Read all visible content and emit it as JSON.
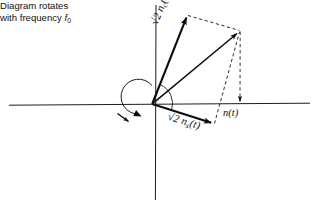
{
  "figure": {
    "background_color": "#ffffff",
    "ink_color": "#0c0c0c",
    "axis_color": "#1d1d1d"
  },
  "axes": {
    "horizontal": {
      "name": "horizontal-axis",
      "y": 104,
      "x_start": 9,
      "x_end": 310
    },
    "vertical": {
      "name": "vertical-axis",
      "x": 156,
      "y_start": 5,
      "y_end": 200
    },
    "origin": {
      "x": 152,
      "y": 104
    }
  },
  "vectors": [
    {
      "id": "nc",
      "label_text": "2 n",
      "label_radical": "√",
      "label_sub": "c",
      "label_suffix": "(t)",
      "label_full": "√2 nc(t)",
      "from": {
        "x": 152,
        "y": 104
      },
      "to": {
        "x": 187,
        "y": 15
      },
      "style": "solid"
    },
    {
      "id": "ns",
      "label_text": "2 n",
      "label_radical": "√",
      "label_sub": "s",
      "label_suffix": "(t)",
      "label_full": "√2 ns(t)",
      "from": {
        "x": 152,
        "y": 104
      },
      "to": {
        "x": 214,
        "y": 124
      },
      "style": "solid"
    },
    {
      "id": "resultant",
      "label_text": "n",
      "label_suffix": "(t)",
      "label_full": "n(t)",
      "from": {
        "x": 152,
        "y": 104
      },
      "to": {
        "x": 240,
        "y": 31
      },
      "style": "solid"
    }
  ],
  "construction_lines": [
    {
      "id": "nc-to-resultant",
      "from": {
        "x": 187,
        "y": 15
      },
      "to": {
        "x": 240,
        "y": 31
      },
      "style": "dashed"
    },
    {
      "id": "ns-to-resultant",
      "from": {
        "x": 214,
        "y": 124
      },
      "to": {
        "x": 240,
        "y": 31
      },
      "style": "dashed"
    },
    {
      "id": "projection-drop",
      "from": {
        "x": 240,
        "y": 31
      },
      "to": {
        "x": 240,
        "y": 104
      },
      "style": "dashed"
    }
  ],
  "arcs": {
    "rotation_circle": {
      "name": "rotation-arc",
      "cx": 152,
      "cy": 103,
      "r": 17.5,
      "direction": "counterclockwise"
    },
    "angle_arc": {
      "name": "angle-arc",
      "cx": 152,
      "cy": 104,
      "r": 21,
      "from_vector": "nc",
      "to_vector": "ns"
    }
  },
  "labels": {
    "nc": {
      "radical": "√",
      "main": "2 n",
      "sub": "c",
      "suffix": "(t)"
    },
    "ns": {
      "radical": "√",
      "main": "2 n",
      "sub": "s",
      "suffix": "(t)"
    },
    "nt": {
      "main": "n",
      "suffix": "(t)"
    },
    "caption_line1": "Diagram rotates",
    "caption_line2_pre": "with frequency ",
    "caption_line2_var": "f",
    "caption_line2_sub": "0"
  }
}
